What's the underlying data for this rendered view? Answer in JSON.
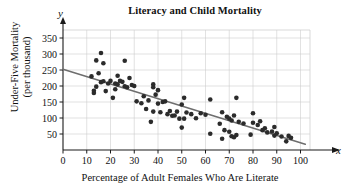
{
  "chart_data": {
    "type": "scatter",
    "title": "Literacy and Child Mortality",
    "xlabel": "Percentage of Adult Females Who Are Literate",
    "ylabel_line1": "Under-Five Mortality",
    "ylabel_line2": "(per thousand)",
    "x_axis_variable": "x",
    "y_axis_variable": "y",
    "xlim": [
      0,
      104
    ],
    "ylim": [
      0,
      375
    ],
    "xticks": [
      0,
      10,
      20,
      30,
      40,
      50,
      60,
      70,
      80,
      90,
      100
    ],
    "yticks": [
      50,
      100,
      150,
      200,
      250,
      300,
      350
    ],
    "grid": true,
    "legend": "none",
    "point_color": "#2b2b2b",
    "line_color": "#6e6e6e",
    "axis_color": "#1a1a1a",
    "grid_color": "#cfcfcf",
    "trendline": {
      "label": "least-squares regression line",
      "x_start": 0,
      "y_start": 252,
      "x_end": 102,
      "y_end": 18
    },
    "points": [
      [
        12,
        230
      ],
      [
        13,
        178
      ],
      [
        13,
        185
      ],
      [
        14,
        280
      ],
      [
        14,
        198
      ],
      [
        15,
        240
      ],
      [
        16,
        303
      ],
      [
        16,
        212
      ],
      [
        17,
        271
      ],
      [
        17,
        215
      ],
      [
        18,
        184
      ],
      [
        19,
        208
      ],
      [
        20,
        216
      ],
      [
        21,
        163
      ],
      [
        22,
        190
      ],
      [
        22,
        208
      ],
      [
        23,
        232
      ],
      [
        23,
        205
      ],
      [
        24,
        216
      ],
      [
        25,
        213
      ],
      [
        26,
        279
      ],
      [
        26,
        199
      ],
      [
        27,
        196
      ],
      [
        28,
        225
      ],
      [
        29,
        203
      ],
      [
        30,
        200
      ],
      [
        31,
        152
      ],
      [
        33,
        146
      ],
      [
        34,
        168
      ],
      [
        35,
        128
      ],
      [
        36,
        155
      ],
      [
        37,
        88
      ],
      [
        38,
        205
      ],
      [
        38,
        196
      ],
      [
        38,
        120
      ],
      [
        39,
        173
      ],
      [
        40,
        187
      ],
      [
        40,
        145
      ],
      [
        41,
        118
      ],
      [
        42,
        150
      ],
      [
        43,
        152
      ],
      [
        44,
        112
      ],
      [
        45,
        122
      ],
      [
        46,
        107
      ],
      [
        47,
        108
      ],
      [
        48,
        120
      ],
      [
        49,
        98
      ],
      [
        50,
        142
      ],
      [
        50,
        70
      ],
      [
        51,
        163
      ],
      [
        51,
        98
      ],
      [
        52,
        117
      ],
      [
        54,
        112
      ],
      [
        56,
        99
      ],
      [
        58,
        115
      ],
      [
        60,
        110
      ],
      [
        62,
        158
      ],
      [
        62,
        51
      ],
      [
        66,
        82
      ],
      [
        67,
        118
      ],
      [
        67,
        35
      ],
      [
        68,
        62
      ],
      [
        69,
        104
      ],
      [
        70,
        57
      ],
      [
        70,
        98
      ],
      [
        71,
        92
      ],
      [
        71,
        43
      ],
      [
        72,
        108
      ],
      [
        72,
        40
      ],
      [
        73,
        163
      ],
      [
        73,
        47
      ],
      [
        74,
        88
      ],
      [
        76,
        83
      ],
      [
        79,
        48
      ],
      [
        80,
        115
      ],
      [
        80,
        85
      ],
      [
        82,
        78
      ],
      [
        83,
        90
      ],
      [
        84,
        62
      ],
      [
        85,
        68
      ],
      [
        86,
        55
      ],
      [
        88,
        58
      ],
      [
        89,
        72
      ],
      [
        89,
        45
      ],
      [
        90,
        52
      ],
      [
        92,
        42
      ],
      [
        94,
        27
      ],
      [
        95,
        44
      ],
      [
        96,
        38
      ]
    ]
  }
}
